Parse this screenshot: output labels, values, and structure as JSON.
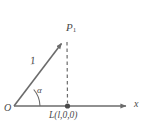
{
  "figure": {
    "type": "geometry-diagram",
    "background_color": "#ffffff",
    "stroke_color": "#6b6b6b",
    "text_color": "#4a4a4a",
    "labels": {
      "point_p1": "P",
      "point_p1_subscript": "1",
      "vector_length": "1",
      "angle": "α",
      "origin": "O",
      "foot_point_prefix": "L(",
      "foot_point_var": "l",
      "foot_point_suffix": ",0,0)",
      "axis_x": "x"
    },
    "geometry": {
      "origin": [
        14,
        106
      ],
      "point_p1": [
        64,
        40
      ],
      "foot_l": [
        68,
        106
      ],
      "axis_start": [
        14,
        106
      ],
      "axis_end": [
        130,
        106
      ],
      "vector_length_value": 1,
      "angle_symbol": "alpha",
      "arc_radius": 26,
      "dashed_line_from": [
        65,
        43
      ],
      "dashed_line_to": [
        68,
        103
      ]
    }
  }
}
